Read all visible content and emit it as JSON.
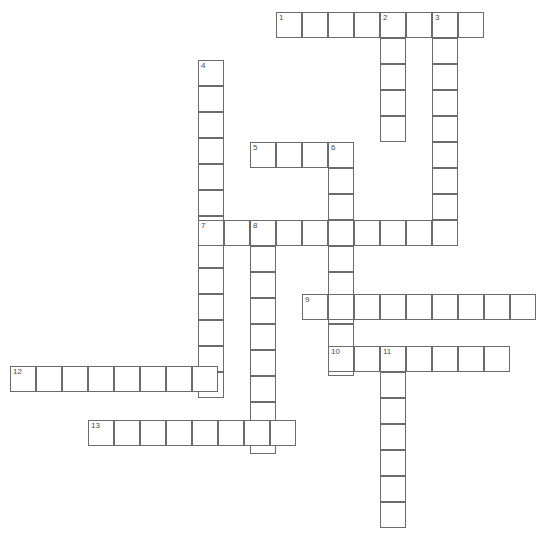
{
  "puzzle": {
    "title": "Crossword Grid",
    "cell_size": 26,
    "canvas": {
      "width": 549,
      "height": 534
    },
    "colors": {
      "cell_border": "#6b6b6b",
      "cell_fill": "#ffffff",
      "number": "#4a4a4a",
      "background": "#ffffff"
    },
    "entries": [
      {
        "number": "1",
        "direction": "across",
        "length": 8,
        "x": 276,
        "y": 12
      },
      {
        "number": "2",
        "direction": "down",
        "length": 5,
        "x": 380,
        "y": 12
      },
      {
        "number": "3",
        "direction": "down",
        "length": 9,
        "x": 432,
        "y": 12
      },
      {
        "number": "4",
        "direction": "down",
        "length": 13,
        "x": 198,
        "y": 60
      },
      {
        "number": "5",
        "direction": "across",
        "length": 4,
        "x": 250,
        "y": 142
      },
      {
        "number": "6",
        "direction": "down",
        "length": 9,
        "x": 328,
        "y": 142
      },
      {
        "number": "7",
        "direction": "across",
        "length": 10,
        "x": 198,
        "y": 220
      },
      {
        "number": "8",
        "direction": "down",
        "length": 9,
        "x": 250,
        "y": 220
      },
      {
        "number": "9",
        "direction": "across",
        "length": 9,
        "x": 302,
        "y": 294
      },
      {
        "number": "10",
        "direction": "across",
        "length": 7,
        "x": 328,
        "y": 346
      },
      {
        "number": "11",
        "direction": "down",
        "length": 7,
        "x": 380,
        "y": 346
      },
      {
        "number": "12",
        "direction": "across",
        "length": 8,
        "x": 10,
        "y": 366
      },
      {
        "number": "13",
        "direction": "across",
        "length": 8,
        "x": 88,
        "y": 420
      }
    ]
  }
}
